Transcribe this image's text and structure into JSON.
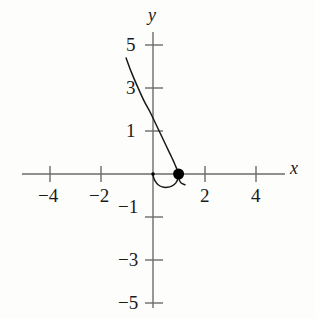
{
  "chart_data": {
    "type": "line",
    "title": "",
    "xlabel": "x",
    "ylabel": "y",
    "xlim": [
      -5.2,
      5.6
    ],
    "ylim": [
      -5.4,
      5.6
    ],
    "grid": false,
    "legend": "none",
    "x_ticks": [
      -4,
      -2,
      2,
      4
    ],
    "x_tick_labels": [
      "−4",
      "−2",
      "2",
      "4"
    ],
    "y_ticks": [
      5,
      3,
      1,
      -1,
      -3,
      -5
    ],
    "y_tick_labels": [
      "5",
      "3",
      "1",
      "−1",
      "−3",
      "−5"
    ],
    "series": [
      {
        "name": "parametric-curve",
        "points": [
          [
            -1.05,
            5.4
          ],
          [
            -0.85,
            4.75
          ],
          [
            -0.6,
            4.05
          ],
          [
            -0.35,
            3.4
          ],
          [
            -0.1,
            2.85
          ],
          [
            0.12,
            2.3
          ],
          [
            0.32,
            1.8
          ],
          [
            0.5,
            1.35
          ],
          [
            0.66,
            0.95
          ],
          [
            0.8,
            0.6
          ],
          [
            0.9,
            0.32
          ],
          [
            0.97,
            0.12
          ],
          [
            1.0,
            0.0
          ],
          [
            0.98,
            -0.2
          ],
          [
            0.9,
            -0.4
          ],
          [
            0.75,
            -0.55
          ],
          [
            0.55,
            -0.62
          ],
          [
            0.36,
            -0.6
          ],
          [
            0.2,
            -0.5
          ],
          [
            0.08,
            -0.32
          ],
          [
            0.02,
            -0.15
          ],
          [
            0.0,
            0.0
          ]
        ]
      },
      {
        "name": "tail-stub",
        "points": [
          [
            1.0,
            0.0
          ],
          [
            1.02,
            -0.25
          ],
          [
            1.1,
            -0.42
          ],
          [
            1.25,
            -0.5
          ]
        ]
      }
    ],
    "markers": [
      {
        "name": "highlighted-point",
        "x": 1.0,
        "y": 0.0,
        "style": "filled-circle",
        "radius": 5.5
      },
      {
        "name": "origin-point",
        "x": 0.0,
        "y": 0.0,
        "style": "filled-circle",
        "radius": 1.8
      }
    ],
    "annotations": []
  },
  "colors": {
    "background": "#fdfdfc",
    "axis": "#6b6b6b",
    "curve": "#1a1a1a",
    "text": "#1a1a1a",
    "marker": "#000000"
  }
}
